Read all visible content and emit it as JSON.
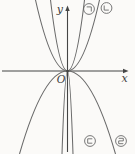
{
  "figure": {
    "width": 135,
    "height": 154,
    "bg": "#fbfaf8",
    "curve_color": "#6a6a6a",
    "axis_color": "#454545",
    "label_color": "#3c3c3c",
    "origin": {
      "x": 67.5,
      "y": 71
    },
    "x_axis": {
      "label": "x",
      "from": 2,
      "to": 124,
      "tip": 128.5,
      "label_x": 124.5,
      "label_y": 82
    },
    "y_axis": {
      "label": "y",
      "from": 152,
      "to": 10.5,
      "tip": 5.5,
      "label_x": 63,
      "label_y": 13
    },
    "origin_label": {
      "text": "O",
      "x": 61,
      "y": 82.5
    },
    "curves": [
      {
        "label": "㉠",
        "glyph": "giyeok",
        "opens": "up",
        "half_width": 17,
        "reach": 71,
        "label_x": 89,
        "label_y": 9
      },
      {
        "label": "㉡",
        "glyph": "nieun",
        "opens": "up",
        "half_width": 32,
        "reach": 71,
        "label_x": 106.5,
        "label_y": 8
      },
      {
        "label": "㉢",
        "glyph": "digeut",
        "opens": "down",
        "half_width": 5.5,
        "reach": 83,
        "label_x": 90,
        "label_y": 141
      },
      {
        "label": "㉣",
        "glyph": "rieul",
        "opens": "down",
        "half_width": 48,
        "reach": 83,
        "label_x": 121,
        "label_y": 141
      }
    ]
  },
  "chart_data": {
    "type": "line",
    "axes": {
      "x_label": "x",
      "y_label": "y",
      "origin_label": "O",
      "grid": false,
      "ticks": "none"
    },
    "series": [
      {
        "name": "㉠",
        "opens": "up",
        "relative_width": "narrow (steep)"
      },
      {
        "name": "㉡",
        "opens": "up",
        "relative_width": "wide (gentle)"
      },
      {
        "name": "㉢",
        "opens": "down",
        "relative_width": "narrowest (branches nearly vertical along y-axis)"
      },
      {
        "name": "㉣",
        "opens": "down",
        "relative_width": "widest (gentle)"
      }
    ],
    "legend_position": "labels placed beside each curve: ㉠ ㉡ top-right, ㉢ ㉣ bottom-right"
  }
}
